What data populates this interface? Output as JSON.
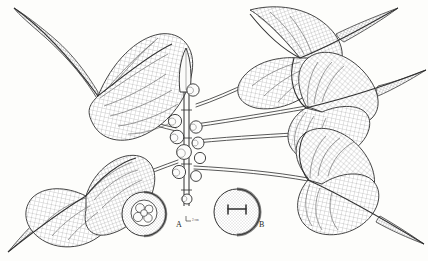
{
  "illustration": {
    "title": "Botanical line illustration of a fig branch",
    "subject": "Ficus branch with cordate long-tipped leaves and clustered figs",
    "technique": "pen-and-ink cross-hatch engraving",
    "background_color": "#fdfdfb",
    "ink_color": "#2b2b2b",
    "hatch_color": "#8d8d8d",
    "vein_color": "#555555"
  },
  "labels": [
    {
      "id": "A",
      "text": "A",
      "x": 176,
      "y": 226,
      "caption": "fig cross-section showing clustered achenes"
    },
    {
      "id": "B",
      "text": "B",
      "x": 259,
      "y": 226,
      "caption": "seed showing H-shaped hilum"
    }
  ],
  "scale_annotation": {
    "text": "2 cm",
    "x": 193,
    "y": 222
  },
  "leaves": [
    {
      "name": "upper-left-leaf",
      "apex_direction": "up-left",
      "cx": 88,
      "cy": 62
    },
    {
      "name": "upper-right-leaf",
      "apex_direction": "up-right",
      "cx": 300,
      "cy": 52
    },
    {
      "name": "middle-right-leaf",
      "apex_direction": "right",
      "cx": 320,
      "cy": 110
    },
    {
      "name": "lower-left-leaf",
      "apex_direction": "down-left",
      "cx": 68,
      "cy": 198
    },
    {
      "name": "lower-right-leaf",
      "apex_direction": "down-right",
      "cx": 330,
      "cy": 185
    }
  ],
  "fig_clusters": [
    {
      "name": "terminal-fig-pair",
      "cx": 190,
      "cy": 92
    },
    {
      "name": "upper-fig-cluster",
      "cx": 178,
      "cy": 124
    },
    {
      "name": "central-fig-cluster",
      "cx": 186,
      "cy": 150
    },
    {
      "name": "lower-fig-pair",
      "cx": 180,
      "cy": 172
    }
  ],
  "detail_circles": [
    {
      "name": "detail-circle-a",
      "cx": 144,
      "cy": 214,
      "r": 22
    },
    {
      "name": "detail-circle-b",
      "cx": 237,
      "cy": 212,
      "r": 23
    }
  ],
  "terminal_stipule": {
    "name": "terminal-stipule",
    "x": 186,
    "y": 62
  }
}
